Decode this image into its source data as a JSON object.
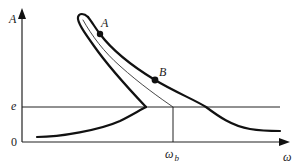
{
  "diagram": {
    "axes": {
      "y_label": "A",
      "x_label": "ω",
      "origin_label": "0"
    },
    "levels": {
      "e_label": "e"
    },
    "markers": {
      "omega_b_main": "ω",
      "omega_b_sub": "b"
    },
    "points": [
      {
        "label": "A",
        "x": 100,
        "y": 34
      },
      {
        "label": "B",
        "x": 155,
        "y": 80
      }
    ],
    "colors": {
      "stroke": "#111111",
      "thin_stroke": "#333333",
      "background": "#ffffff"
    }
  }
}
